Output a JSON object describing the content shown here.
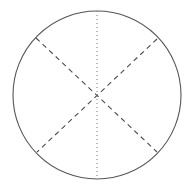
{
  "figure": {
    "background_color": "#ffffff",
    "width": 194,
    "height": 188
  },
  "shapes": {
    "circle": {
      "name": "circle-outline",
      "center_x": 97,
      "center_y": 95,
      "radius": 84,
      "stroke_color": "#555555",
      "stroke_width": 1.1,
      "style": "solid",
      "fill": "none"
    },
    "vertical_axis": {
      "name": "vertical-dotted-axis",
      "x1": 97,
      "y1": 11,
      "x2": 97,
      "y2": 179,
      "stroke_color": "#777777",
      "stroke_width": 1,
      "style": "dotted",
      "dash_pattern": "1 3"
    },
    "diagonal_a": {
      "name": "diagonal-chord-nw-se",
      "x1": 36,
      "y1": 38,
      "x2": 157,
      "y2": 152,
      "stroke_color": "#4a4a4a",
      "stroke_width": 1.1,
      "style": "dashed",
      "dash_pattern": "5 4"
    },
    "diagonal_b": {
      "name": "diagonal-chord-ne-sw",
      "x1": 157,
      "y1": 39,
      "x2": 37,
      "y2": 152,
      "stroke_color": "#4a4a4a",
      "stroke_width": 1.1,
      "style": "dashed",
      "dash_pattern": "5 4"
    }
  },
  "chart_data": {
    "type": "diagram",
    "title": "",
    "xlabel": "",
    "ylabel": "",
    "elements": [
      {
        "id": "circle",
        "kind": "circle",
        "center": [
          97,
          95
        ],
        "radius": 84,
        "linestyle": "solid",
        "color": "#555555"
      },
      {
        "id": "vertical-axis",
        "kind": "line",
        "points": [
          [
            97,
            11
          ],
          [
            97,
            179
          ]
        ],
        "linestyle": "dotted",
        "color": "#777777"
      },
      {
        "id": "chord-nw-se",
        "kind": "line",
        "points": [
          [
            36,
            38
          ],
          [
            157,
            152
          ]
        ],
        "linestyle": "dashed",
        "color": "#4a4a4a"
      },
      {
        "id": "chord-ne-sw",
        "kind": "line",
        "points": [
          [
            157,
            39
          ],
          [
            37,
            152
          ]
        ],
        "linestyle": "dashed",
        "color": "#4a4a4a"
      }
    ],
    "annotations": [],
    "legend": [],
    "grid": false
  }
}
